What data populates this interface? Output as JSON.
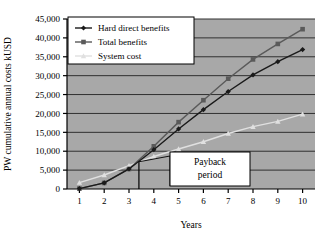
{
  "chart_data": {
    "type": "line",
    "title": "",
    "xlabel": "Years",
    "ylabel": "PW cumulative annual costs kUSD",
    "x": [
      1,
      2,
      3,
      4,
      5,
      6,
      7,
      8,
      9,
      10
    ],
    "categories": [
      "1",
      "2",
      "3",
      "4",
      "5",
      "6",
      "7",
      "8",
      "9",
      "10"
    ],
    "xlim": [
      0.5,
      10.5
    ],
    "ylim": [
      0,
      45000
    ],
    "ytick_labels": [
      "0",
      "5,000",
      "10,000",
      "15,000",
      "20,000",
      "25,000",
      "30,000",
      "35,000",
      "40,000",
      "45,000"
    ],
    "ytick_values": [
      0,
      5000,
      10000,
      15000,
      20000,
      25000,
      30000,
      35000,
      40000,
      45000
    ],
    "grid": true,
    "grid_axis": "y",
    "legend_position": "upper-left",
    "series": [
      {
        "name": "Hard direct benefits",
        "marker": "diamond",
        "color": "#1a1a1a",
        "values": [
          100,
          1600,
          5300,
          10400,
          15900,
          21000,
          25800,
          30200,
          33700,
          36900
        ]
      },
      {
        "name": "Total benefits",
        "marker": "square",
        "color": "#5a5a5a",
        "values": [
          100,
          1600,
          5300,
          11300,
          17700,
          23500,
          29200,
          34300,
          38400,
          42300
        ]
      },
      {
        "name": "System cost",
        "marker": "triangle",
        "color": "#e0e0e0",
        "values": [
          1700,
          3700,
          6200,
          8600,
          10600,
          12500,
          14700,
          16500,
          17900,
          19800
        ]
      }
    ],
    "annotations": [
      {
        "name": "payback-period",
        "text_line1": "Payback",
        "text_line2": "period",
        "marker_x": 3.4,
        "description": "Vertical line at year ~3.4 marking payback point with callout box"
      }
    ],
    "plot_background": "#a8a8a8",
    "grid_color": "#303030",
    "axis_color": "#000000"
  },
  "legend": {
    "items": [
      {
        "label": "Hard direct benefits",
        "marker": "diamond",
        "color": "#1a1a1a"
      },
      {
        "label": "Total benefits",
        "marker": "square",
        "color": "#5a5a5a"
      },
      {
        "label": "System cost",
        "marker": "triangle",
        "color": "#e0e0e0"
      }
    ]
  },
  "axes": {
    "x_title": "Years",
    "y_title": "PW cumulative annual costs kUSD",
    "x_ticks": [
      "1",
      "2",
      "3",
      "4",
      "5",
      "6",
      "7",
      "8",
      "9",
      "10"
    ],
    "y_ticks": [
      "0",
      "5,000",
      "10,000",
      "15,000",
      "20,000",
      "25,000",
      "30,000",
      "35,000",
      "40,000",
      "45,000"
    ]
  },
  "annotation": {
    "line1": "Payback",
    "line2": "period"
  }
}
